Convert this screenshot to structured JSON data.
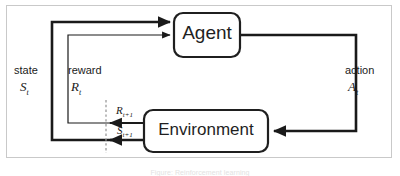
{
  "figure": {
    "kind": "reinforcement-learning-agent-environment-loop",
    "caption": "Figure: Reinforcement learning",
    "frame_color": "#c9c9c9",
    "background_color": "#ffffff",
    "line_color": "#1a1a1a",
    "dashed_line_color": "#9a9a9a"
  },
  "nodes": {
    "agent": {
      "label": "Agent",
      "shape": "rounded-rectangle",
      "x": 174,
      "y": 13,
      "width": 66,
      "height": 44
    },
    "environment": {
      "label": "Environment",
      "shape": "rounded-rectangle",
      "x": 144,
      "y": 110,
      "width": 124,
      "height": 42
    }
  },
  "labels": {
    "state_word": "state",
    "state_symbol": "S",
    "state_subscript": "t",
    "reward_word": "reward",
    "reward_symbol": "R",
    "reward_subscript": "t",
    "action_word": "action",
    "action_symbol": "A",
    "action_subscript": "t",
    "next_reward_symbol": "R",
    "next_reward_subscript": "t+1",
    "next_state_symbol": "S",
    "next_state_subscript": "t+1"
  },
  "edges": [
    {
      "name": "action-edge",
      "from": "agent",
      "to": "environment",
      "label": "action A_t",
      "stroke_width": 2.6,
      "path": "M 240,35 L 356,35 L 356,131 L 272,131"
    },
    {
      "name": "state-edge",
      "from": "environment",
      "to": "agent",
      "label": "state S_t",
      "stroke_width": 2.6,
      "path": "M 140,140 L 52,140 L 52,22 L 170,22"
    },
    {
      "name": "reward-edge",
      "from": "environment",
      "to": "agent",
      "label": "reward R_t",
      "stroke_width": 1.3,
      "path": "M 140,123 L 68,123 L 68,35 L 170,35"
    },
    {
      "name": "next-reward-edge",
      "from": "environment",
      "to": "time-boundary",
      "label": "R_t+1",
      "stroke_width": 1.6,
      "path": "M 144,123 L 110,123"
    },
    {
      "name": "next-state-edge",
      "from": "environment",
      "to": "time-boundary",
      "label": "S_t+1",
      "stroke_width": 2.6,
      "path": "M 144,140 L 110,140"
    },
    {
      "name": "time-boundary",
      "type": "dashed-vertical-line",
      "path": "M 106,100 L 106,152"
    }
  ]
}
